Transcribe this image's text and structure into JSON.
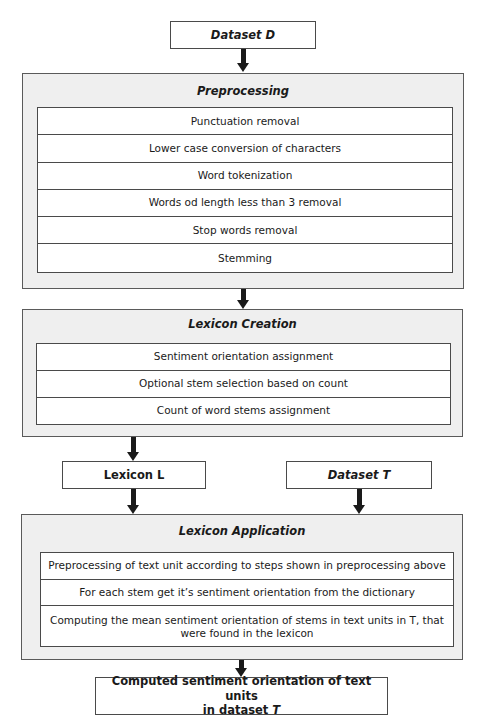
{
  "diagram": {
    "dataset_d": {
      "label": "Dataset D"
    },
    "preprocessing": {
      "title": "Preprocessing",
      "steps": [
        "Punctuation removal",
        "Lower case conversion of characters",
        "Word tokenization",
        "Words od length less than 3 removal",
        "Stop words removal",
        "Stemming"
      ]
    },
    "lexicon_creation": {
      "title": "Lexicon Creation",
      "steps": [
        "Sentiment orientation assignment",
        "Optional stem selection based on count",
        "Count of word stems assignment"
      ]
    },
    "lexicon_l": {
      "label": "Lexicon L"
    },
    "dataset_t": {
      "label": "Dataset T"
    },
    "lexicon_application": {
      "title": "Lexicon Application",
      "steps": [
        "Preprocessing of text unit according to steps shown in preprocessing above",
        "For each stem get it’s sentiment orientation from the dictionary",
        "Computing the mean sentiment orientation of stems in text units in T, that were found in the lexicon"
      ]
    },
    "output": {
      "label_line1": "Computed sentiment orientation of text units",
      "label_line2_prefix": "in dataset ",
      "label_line2_var": "T"
    },
    "colors": {
      "group_fill": "#efefef",
      "border": "#4a4a4a",
      "arrow": "#1a1a1a",
      "box_fill": "#ffffff"
    }
  }
}
